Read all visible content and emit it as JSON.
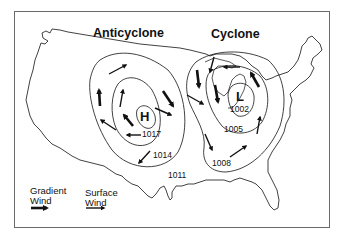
{
  "diagram": {
    "type": "weather-map",
    "titles": {
      "anticyclone": "Anticyclone",
      "cyclone": "Cyclone"
    },
    "centers": {
      "high": "H",
      "low": "L"
    },
    "isobars": {
      "anticyclone": [
        "1017",
        "1014"
      ],
      "cyclone": [
        "1002",
        "1005",
        "1008"
      ],
      "background": "1011"
    },
    "legend": {
      "gradient_wind_line1": "Gradient",
      "gradient_wind_line2": "Wind",
      "surface_wind_line1": "Surface",
      "surface_wind_line2": "Wind"
    },
    "colors": {
      "ink": "#111111",
      "frame": "#6a6a6a",
      "background": "#ffffff"
    }
  }
}
